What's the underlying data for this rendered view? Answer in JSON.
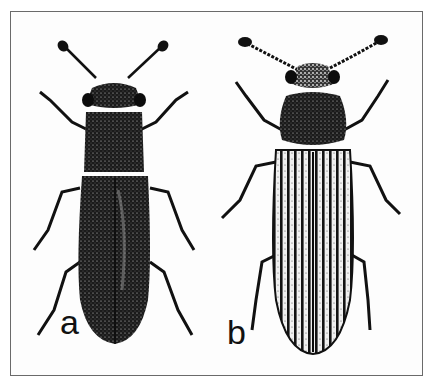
{
  "figure": {
    "type": "scientific-illustration",
    "colors": {
      "ink": "#111111",
      "background": "#ffffff",
      "frame": "#6a6a6a"
    },
    "specimens": [
      {
        "id": "a",
        "label": "a",
        "description": "beetle with dark, smooth elytra and square pronotum"
      },
      {
        "id": "b",
        "label": "b",
        "description": "beetle with striated (ribbed) elytra and rounded pronotum, beaded antennae"
      }
    ]
  }
}
